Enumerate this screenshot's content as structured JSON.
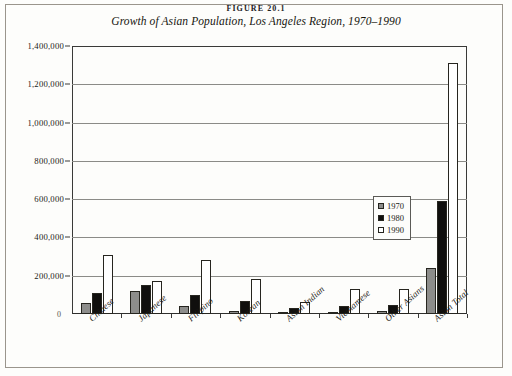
{
  "figure": {
    "number": "FIGURE 20.1",
    "title": "Growth of Asian Population, Los Angeles Region, 1970–1990",
    "origin_label": "0"
  },
  "legend": {
    "position": "inside-center",
    "entries": [
      {
        "label": "1970",
        "color": "#8d8d8b",
        "swatch": "gray-square-icon"
      },
      {
        "label": "1980",
        "color": "#100f0d",
        "swatch": "black-square-icon"
      },
      {
        "label": "1990",
        "color": "#ffffff",
        "swatch": "white-square-icon"
      }
    ]
  },
  "axis": {
    "y_ticks": [
      {
        "value": 1400000,
        "label": "1,400,000"
      },
      {
        "value": 1200000,
        "label": "1,200,000"
      },
      {
        "value": 1000000,
        "label": "1,000,000"
      },
      {
        "value": 800000,
        "label": "800,000"
      },
      {
        "value": 600000,
        "label": "600,000"
      },
      {
        "value": 400000,
        "label": "400,000"
      },
      {
        "value": 200000,
        "label": "200,000"
      }
    ]
  },
  "chart_data": {
    "type": "bar",
    "title": "Growth of Asian Population, Los Angeles Region, 1970–1990",
    "xlabel": "",
    "ylabel": "",
    "ylim": [
      0,
      1400000
    ],
    "ytick_step": 200000,
    "grid": true,
    "legend_position": "inside-center",
    "categories": [
      "Chinese",
      "Japanese",
      "Filipino",
      "Korean",
      "Asian Indian",
      "Vietnamese",
      "Other Asians",
      "Asian Total"
    ],
    "series": [
      {
        "name": "1970",
        "color": "#8d8d8b",
        "values": [
          60000,
          120000,
          40000,
          15000,
          10000,
          4000,
          18000,
          240000
        ]
      },
      {
        "name": "1980",
        "color": "#100f0d",
        "values": [
          110000,
          150000,
          100000,
          70000,
          30000,
          40000,
          45000,
          590000
        ]
      },
      {
        "name": "1990",
        "color": "#ffffff",
        "values": [
          310000,
          170000,
          280000,
          185000,
          65000,
          130000,
          130000,
          1310000
        ]
      }
    ]
  }
}
